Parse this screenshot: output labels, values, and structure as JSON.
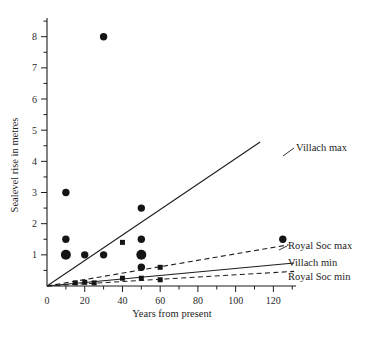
{
  "chart_data": {
    "type": "scatter",
    "title": "",
    "xlabel": "Years from present",
    "ylabel": "Sealevel rise in metres",
    "xlim": [
      0,
      132
    ],
    "ylim": [
      0,
      8.6
    ],
    "grid": false,
    "legend_position": "right-inline-labels",
    "x_ticks_major": [
      0,
      20,
      40,
      60,
      80,
      100,
      120
    ],
    "x_ticks_minor": [
      10,
      30,
      50,
      70,
      90,
      110,
      130
    ],
    "x_tick_labels": [
      "0",
      "20",
      "40",
      "60",
      "80",
      "100",
      "120"
    ],
    "y_ticks_major": [
      1,
      2,
      3,
      4,
      5,
      6,
      7,
      8
    ],
    "y_ticks_minor": [
      0.5,
      1.5,
      2.5,
      3.5,
      4.5,
      5.5,
      6.5,
      7.5,
      8.5
    ],
    "y_tick_labels": [
      "1",
      "2",
      "3",
      "4",
      "5",
      "6",
      "7",
      "8"
    ],
    "series": [
      {
        "name": "Scatter estimates (large)",
        "marker": "circle",
        "marker_size": "large",
        "points": [
          {
            "x": 10,
            "y": 1.0
          },
          {
            "x": 50,
            "y": 1.0
          }
        ]
      },
      {
        "name": "Scatter estimates (medium)",
        "marker": "circle",
        "marker_size": "medium",
        "points": [
          {
            "x": 30,
            "y": 8.0
          },
          {
            "x": 10,
            "y": 3.0
          },
          {
            "x": 50,
            "y": 2.5
          },
          {
            "x": 10,
            "y": 1.5
          },
          {
            "x": 50,
            "y": 1.5
          },
          {
            "x": 20,
            "y": 1.0
          },
          {
            "x": 30,
            "y": 1.0
          },
          {
            "x": 50,
            "y": 0.6
          },
          {
            "x": 125,
            "y": 1.5
          }
        ]
      },
      {
        "name": "Scenario points on trends",
        "marker": "square",
        "marker_size": "small",
        "points": [
          {
            "x": 40,
            "y": 1.4
          },
          {
            "x": 60,
            "y": 0.6
          },
          {
            "x": 40,
            "y": 0.25
          },
          {
            "x": 50,
            "y": 0.25
          },
          {
            "x": 60,
            "y": 0.2
          },
          {
            "x": 20,
            "y": 0.12
          },
          {
            "x": 15,
            "y": 0.1
          },
          {
            "x": 25,
            "y": 0.1
          }
        ]
      }
    ],
    "trend_lines": [
      {
        "name": "Villach max",
        "style": "solid",
        "label": "Villach max",
        "from": {
          "x": 0,
          "y": 0
        },
        "to": {
          "x": 113,
          "y": 4.62
        }
      },
      {
        "name": "Royal Soc max",
        "style": "dashed",
        "label": "Royal Soc max",
        "from": {
          "x": 0,
          "y": 0
        },
        "to": {
          "x": 128,
          "y": 1.32
        }
      },
      {
        "name": "Villach min",
        "style": "solid",
        "label": "Villach min",
        "from": {
          "x": 0,
          "y": 0
        },
        "to": {
          "x": 131,
          "y": 0.74
        }
      },
      {
        "name": "Royal Soc min",
        "style": "dashed",
        "label": "Royal Soc min",
        "from": {
          "x": 0,
          "y": 0
        },
        "to": {
          "x": 131,
          "y": 0.47
        }
      }
    ],
    "annotations": [
      {
        "text": "Villach max",
        "x": 296,
        "y": 151
      },
      {
        "text": "Royal Soc max",
        "x": 288,
        "y": 249
      },
      {
        "text": "Villach min",
        "x": 288,
        "y": 266
      },
      {
        "text": "Royal Soc min",
        "x": 288,
        "y": 280
      }
    ]
  }
}
